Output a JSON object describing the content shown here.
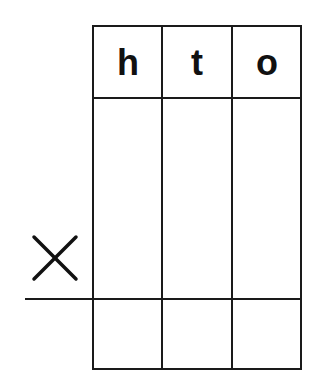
{
  "worksheet": {
    "type": "column multiplication grid",
    "headers": [
      "h",
      "t",
      "o"
    ],
    "operator": "×",
    "operator_icon": "multiplication-sign-icon",
    "rows": [
      {
        "name": "multiplicand-row",
        "cells": [
          "",
          "",
          ""
        ]
      },
      {
        "name": "result-row",
        "cells": [
          "",
          "",
          ""
        ]
      }
    ],
    "colors": {
      "line": "#1a1a1a",
      "text": "#111111",
      "background": "#ffffff"
    }
  }
}
